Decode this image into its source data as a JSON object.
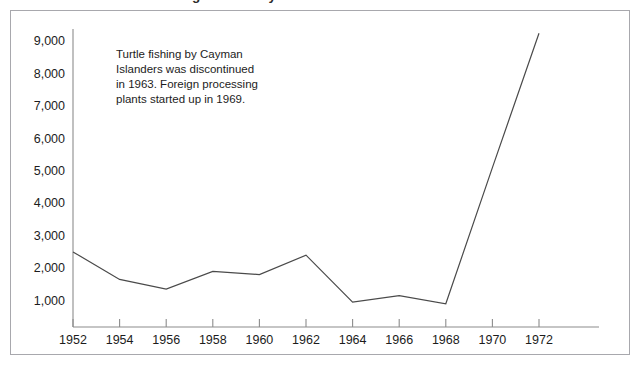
{
  "figure": {
    "title": "Turtle landings in the Cayman Islands",
    "frame_color": "#a8a8ad",
    "background": "#ffffff"
  },
  "annotation": {
    "lines": [
      "Turtle fishing by Cayman",
      "Islanders was discontinued",
      "in 1963. Foreign processing",
      "plants started up in 1969."
    ]
  },
  "chart_data": {
    "type": "line",
    "title": "Turtle landings in the Cayman Islands",
    "xlabel": "",
    "ylabel": "",
    "x": [
      1952,
      1954,
      1956,
      1958,
      1960,
      1962,
      1964,
      1966,
      1968,
      1970,
      1972
    ],
    "values": [
      2500,
      1650,
      1350,
      1900,
      1800,
      2400,
      950,
      1150,
      900,
      5100,
      9250
    ],
    "series": [
      {
        "name": "Turtle landings",
        "values": [
          2500,
          1650,
          1350,
          1900,
          1800,
          2400,
          950,
          1150,
          900,
          5100,
          9250
        ],
        "color": "#4a4a4a"
      }
    ],
    "x_tick_labels": [
      "1952",
      "1954",
      "1956",
      "1958",
      "1960",
      "1962",
      "1964",
      "1966",
      "1968",
      "1970",
      "1972"
    ],
    "y_tick_labels": [
      "1,000",
      "2,000",
      "3,000",
      "4,000",
      "5,000",
      "6,000",
      "7,000",
      "8,000",
      "9,000"
    ],
    "y_tick_values": [
      1000,
      2000,
      3000,
      4000,
      5000,
      6000,
      7000,
      8000,
      9000
    ],
    "xlim": [
      1952,
      1972
    ],
    "ylim": [
      0,
      9600
    ],
    "grid": false,
    "legend": "none",
    "annotations": [
      {
        "text": "Turtle fishing by Cayman Islanders was discontinued in 1963. Foreign processing plants started up in 1969.",
        "x": 1953,
        "y": 8700
      }
    ]
  }
}
